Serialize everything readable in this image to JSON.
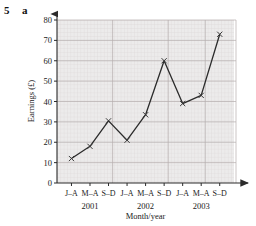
{
  "header": {
    "question_number": "5",
    "question_part": "a"
  },
  "chart_data": {
    "type": "line",
    "title": "",
    "xlabel": "Month/year",
    "ylabel": "Earnings (£)",
    "categories": [
      "J–A",
      "M–A",
      "S–D",
      "J–A",
      "M–A",
      "S–D",
      "J–A",
      "M–A",
      "S–D"
    ],
    "group_labels": [
      "2001",
      "2002",
      "2003"
    ],
    "values": [
      12,
      18,
      30.5,
      21,
      33.5,
      60,
      39,
      43,
      73
    ],
    "ylim": [
      0,
      80
    ],
    "yticks": [
      "0",
      "10",
      "20",
      "30",
      "40",
      "50",
      "60",
      "70",
      "80"
    ],
    "ytick_values": [
      0,
      10,
      20,
      30,
      40,
      50,
      60,
      70,
      80
    ],
    "grid": true,
    "grid_minor": true,
    "legend": "none",
    "marker": "x",
    "line_color": "#2b2b2b",
    "grid_major_color": "#b9b3b3",
    "grid_minor_color": "#ddd6d6",
    "plot_bg": "#eceaea"
  }
}
